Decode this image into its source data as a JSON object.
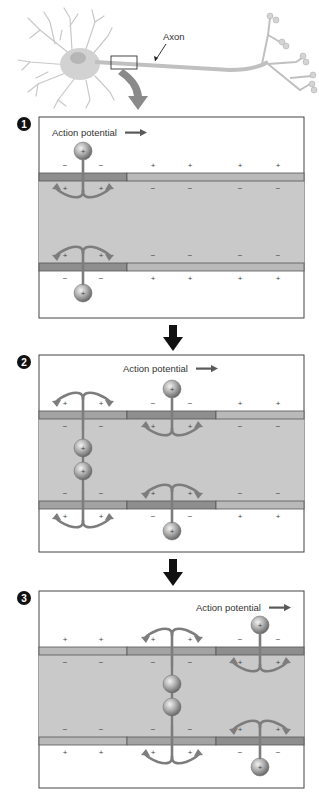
{
  "neuron": {
    "axon_label": "Axon"
  },
  "colors": {
    "cytoplasm": "#c9c9c9",
    "membrane_resting": "#b9b9b9",
    "membrane_active": "#8e8e8e",
    "membrane_outline": "#555555",
    "ion_arrow": "#7d7d7d",
    "arrow_black": "#111111",
    "panel_border": "#444444",
    "action_arrow": "#5a5a5a"
  },
  "panels": [
    {
      "step": "1",
      "action_label": "Action potential",
      "top": 117,
      "bottom": 318,
      "action_label_x": 52,
      "action_label_y": 136,
      "segments": [
        {
          "from": 39,
          "to": 127,
          "state": "active"
        },
        {
          "from": 127,
          "to": 304,
          "state": "resting"
        }
      ],
      "outside_signs_top": [
        "−",
        "−",
        "+",
        "+",
        "+",
        "+"
      ],
      "inside_signs_top": [
        "+",
        "+",
        "−",
        "−",
        "−",
        "−"
      ],
      "inside_signs_bottom": [
        "+",
        "+",
        "−",
        "−",
        "−",
        "−"
      ],
      "outside_signs_bottom": [
        "−",
        "−",
        "+",
        "+",
        "+",
        "+"
      ],
      "ion_channels": [
        {
          "x": 83,
          "type": "influx"
        }
      ],
      "inside_ions": []
    },
    {
      "step": "2",
      "action_label": "Action potential",
      "top": 355,
      "bottom": 552,
      "action_label_x": 123,
      "action_label_y": 372,
      "segments": [
        {
          "from": 39,
          "to": 127,
          "state": "mid"
        },
        {
          "from": 127,
          "to": 216,
          "state": "active"
        },
        {
          "from": 216,
          "to": 304,
          "state": "resting"
        }
      ],
      "outside_signs_top": [
        "+",
        "+",
        "−",
        "−",
        "+",
        "+"
      ],
      "inside_signs_top": [
        "−",
        "−",
        "+",
        "+",
        "−",
        "−"
      ],
      "inside_signs_bottom": [
        "−",
        "−",
        "+",
        "+",
        "−",
        "−"
      ],
      "outside_signs_bottom": [
        "+",
        "+",
        "−",
        "−",
        "+",
        "+"
      ],
      "ion_channels": [
        {
          "x": 83,
          "type": "efflux"
        },
        {
          "x": 172,
          "type": "influx"
        }
      ],
      "inside_ions": [
        {
          "x": 83
        }
      ]
    },
    {
      "step": "3",
      "action_label": "Action potential",
      "top": 591,
      "bottom": 788,
      "action_label_x": 196,
      "action_label_y": 611,
      "segments": [
        {
          "from": 39,
          "to": 127,
          "state": "resting"
        },
        {
          "from": 127,
          "to": 216,
          "state": "mid"
        },
        {
          "from": 216,
          "to": 304,
          "state": "active"
        }
      ],
      "outside_signs_top": [
        "+",
        "+",
        "+",
        "+",
        "−",
        "−"
      ],
      "inside_signs_top": [
        "−",
        "−",
        "−",
        "−",
        "+",
        "+"
      ],
      "inside_signs_bottom": [
        "−",
        "−",
        "−",
        "−",
        "+",
        "+"
      ],
      "outside_signs_bottom": [
        "+",
        "+",
        "+",
        "+",
        "−",
        "−"
      ],
      "ion_channels": [
        {
          "x": 172,
          "type": "efflux"
        },
        {
          "x": 260,
          "type": "influx"
        }
      ],
      "inside_ions": [
        {
          "x": 172
        }
      ]
    }
  ],
  "ion_symbol": "+",
  "sign_positions_x": [
    65,
    101,
    153,
    190,
    240,
    278
  ]
}
